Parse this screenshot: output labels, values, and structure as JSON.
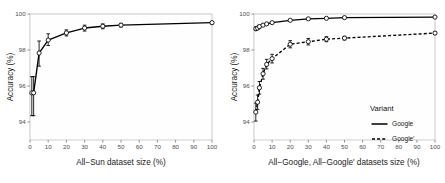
{
  "figure": {
    "title": "",
    "panels": [
      "All-Sun scaling curve",
      "All-Google / All-Google' scaling curves"
    ]
  },
  "axis": {
    "y_label": "Accuracy (%)",
    "y_ticks": [
      "100",
      "98",
      "96",
      "94"
    ],
    "x_ticks": [
      "0",
      "10",
      "20",
      "30",
      "40",
      "50",
      "60",
      "70",
      "80",
      "90",
      "100"
    ],
    "x_label_left": "All−Sun dataset size (%)",
    "x_label_right": "All−Google, All−Google' datasets size (%)"
  },
  "legend": {
    "title": "Variant",
    "items": [
      {
        "label": "Google",
        "style": "solid"
      },
      {
        "label": "Google'",
        "style": "dashed"
      }
    ]
  },
  "colors": {
    "line": "#000000",
    "marker_fill": "#ffffff",
    "panel_bg": "#fefefe",
    "grid_major": "#ebebeb",
    "grid_minor": "#f4f4f4",
    "axis_text": "#4d4d4d",
    "panel_border": "#b9b9b9"
  },
  "chart_data": [
    {
      "type": "line",
      "title": "All-Sun dataset size vs Accuracy",
      "xlabel": "All−Sun dataset size (%)",
      "ylabel": "Accuracy (%)",
      "xlim": [
        0,
        100
      ],
      "ylim": [
        93.0,
        100.0
      ],
      "grid": true,
      "legend": "none",
      "x": [
        1,
        2,
        5,
        10,
        20,
        30,
        40,
        50,
        100
      ],
      "series": [
        {
          "name": "All-Sun",
          "style": "solid",
          "marker": "open-circle",
          "values": [
            95.62,
            95.62,
            97.83,
            98.55,
            98.95,
            99.22,
            99.32,
            99.38,
            99.52
          ],
          "err_low": [
            94.35,
            94.35,
            97.1,
            98.25,
            98.78,
            99.05,
            99.18,
            99.28,
            99.45
          ],
          "err_high": [
            96.52,
            96.52,
            98.5,
            98.9,
            99.12,
            99.38,
            99.45,
            99.48,
            99.58
          ]
        }
      ]
    },
    {
      "type": "line",
      "title": "All-Google / All-Google' datasets size vs Accuracy",
      "xlabel": "All−Google, All−Google' datasets size (%)",
      "ylabel": "Accuracy (%)",
      "xlim": [
        0,
        100
      ],
      "ylim": [
        93.0,
        100.0
      ],
      "grid": true,
      "legend": "inside-bottom-right",
      "legend_title": "Variant",
      "x": [
        1,
        2,
        3,
        5,
        7,
        10,
        20,
        30,
        40,
        50,
        100
      ],
      "series": [
        {
          "name": "Google",
          "style": "solid",
          "marker": "open-circle",
          "values": [
            99.18,
            99.22,
            99.3,
            99.38,
            99.45,
            99.52,
            99.65,
            99.73,
            99.76,
            99.8,
            99.83
          ],
          "err_low": [
            99.08,
            99.14,
            99.22,
            99.32,
            99.4,
            99.47,
            99.61,
            99.7,
            99.74,
            99.78,
            99.81
          ],
          "err_high": [
            99.28,
            99.3,
            99.38,
            99.44,
            99.5,
            99.57,
            99.69,
            99.76,
            99.79,
            99.82,
            99.85
          ]
        },
        {
          "name": "Google'",
          "style": "dashed",
          "marker": "open-circle",
          "values": [
            94.55,
            95.1,
            95.9,
            96.68,
            97.2,
            97.52,
            98.32,
            98.46,
            98.6,
            98.66,
            98.94
          ],
          "err_low": [
            94.05,
            94.7,
            95.55,
            96.38,
            96.95,
            97.28,
            98.12,
            98.28,
            98.46,
            98.56,
            98.86
          ],
          "err_high": [
            95.05,
            95.5,
            96.25,
            96.98,
            97.48,
            97.76,
            98.52,
            98.64,
            98.74,
            98.76,
            99.02
          ]
        }
      ]
    }
  ]
}
